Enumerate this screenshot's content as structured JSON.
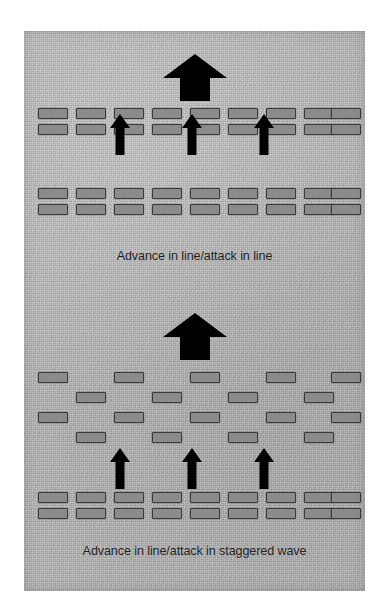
{
  "figure": {
    "background_color": "#b4b4b4",
    "unit_fill_color": "#8b8b8b",
    "unit_border_color": "#3a3a3a",
    "arrow_color": "#000000",
    "caption_color": "#1d1d1d"
  },
  "diagrams": [
    {
      "id": "advance-in-line",
      "caption": "Advance in line/attack in line",
      "caption_y": 217,
      "main_arrow": {
        "name": "main-advance-arrow-top",
        "x": 139,
        "y": 23,
        "width": 64,
        "height": 47
      },
      "attack_arrows": [
        {
          "name": "attack-arrow-left",
          "x": 86,
          "y": 83,
          "width": 20,
          "height": 41
        },
        {
          "name": "attack-arrow-center",
          "x": 158,
          "y": 83,
          "width": 20,
          "height": 41
        },
        {
          "name": "attack-arrow-right",
          "x": 230,
          "y": 83,
          "width": 20,
          "height": 41
        }
      ],
      "formations": [
        {
          "name": "front-line-formation",
          "type": "line",
          "rows": [
            {
              "y": 77,
              "xs": [
                14,
                52,
                90,
                128,
                166,
                204,
                242,
                280,
                307
              ]
            },
            {
              "y": 93,
              "xs": [
                14,
                52,
                90,
                128,
                166,
                204,
                242,
                280,
                307
              ]
            }
          ]
        },
        {
          "name": "rear-line-formation",
          "type": "line",
          "rows": [
            {
              "y": 157,
              "xs": [
                14,
                52,
                90,
                128,
                166,
                204,
                242,
                280,
                307
              ]
            },
            {
              "y": 173,
              "xs": [
                14,
                52,
                90,
                128,
                166,
                204,
                242,
                280,
                307
              ]
            }
          ]
        }
      ]
    },
    {
      "id": "advance-in-staggered-wave",
      "caption": "Advance in line/attack in staggered wave",
      "caption_y": 512,
      "main_arrow": {
        "name": "main-advance-arrow-bottom",
        "x": 139,
        "y": 282,
        "width": 64,
        "height": 47
      },
      "attack_arrows": [
        {
          "name": "attack-arrow-left",
          "x": 86,
          "y": 417,
          "width": 20,
          "height": 41
        },
        {
          "name": "attack-arrow-center",
          "x": 158,
          "y": 417,
          "width": 20,
          "height": 41
        },
        {
          "name": "attack-arrow-right",
          "x": 230,
          "y": 417,
          "width": 20,
          "height": 41
        }
      ],
      "formations": [
        {
          "name": "staggered-wave-formation",
          "type": "staggered",
          "rows": [
            {
              "y": 341,
              "xs": [
                14,
                90,
                166,
                242,
                307
              ]
            },
            {
              "y": 361,
              "xs": [
                52,
                128,
                204,
                280
              ]
            },
            {
              "y": 381,
              "xs": [
                14,
                90,
                166,
                242,
                307
              ]
            },
            {
              "y": 401,
              "xs": [
                52,
                128,
                204,
                280
              ]
            }
          ]
        },
        {
          "name": "rear-line-formation",
          "type": "line",
          "rows": [
            {
              "y": 461,
              "xs": [
                14,
                52,
                90,
                128,
                166,
                204,
                242,
                280,
                307
              ]
            },
            {
              "y": 477,
              "xs": [
                14,
                52,
                90,
                128,
                166,
                204,
                242,
                280,
                307
              ]
            }
          ]
        }
      ]
    }
  ]
}
